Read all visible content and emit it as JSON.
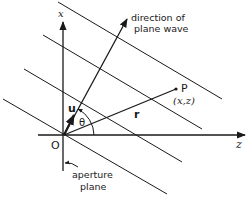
{
  "diagram": {
    "axes": {
      "vertical_label": "x",
      "horizontal_label": "z",
      "origin_label": "O"
    },
    "labels": {
      "direction_line1": "direction of",
      "direction_line2": "plane wave",
      "point_label": "P",
      "point_coords": "(x,z)",
      "radius_label": "r",
      "unit_vector_label": "u",
      "angle_label": "θ",
      "aperture_line1": "aperture",
      "aperture_line2": "plane"
    },
    "wavefront_count": 4,
    "colors": {
      "line": "#1a1a1a",
      "background": "#ffffff"
    }
  }
}
